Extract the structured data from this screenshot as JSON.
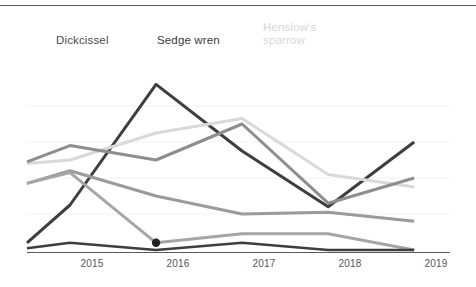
{
  "figure": {
    "background_color": "#ffffff",
    "top_rule_color": "#5a5a5e",
    "axis_color": "#5a5a5e",
    "gridline_color": "#f2f2f2"
  },
  "annotations": {
    "dickcissel": {
      "text": "Dickcissel",
      "color": "#4a4a4e"
    },
    "sedge_wren": {
      "text": "Sedge wren",
      "color": "#3a3a3e"
    },
    "henslows_sparrow": {
      "text": "Henslow's\nsparrow",
      "color": "#d8d8d8"
    }
  },
  "axis": {
    "tick_2015": "2015",
    "tick_2016": "2016",
    "tick_2017": "2017",
    "tick_2018": "2018",
    "tick_2019": "2019"
  },
  "chart_data": {
    "type": "line",
    "title": "",
    "subtitle": "",
    "xlabel": "",
    "ylabel": "",
    "grid": true,
    "grid_axis": "y",
    "legend": "inline-annotations",
    "legend_position": "top",
    "x": [
      2014.5,
      2015,
      2016,
      2017,
      2018,
      2019
    ],
    "xtick_labels": [
      "2015",
      "2016",
      "2017",
      "2018",
      "2019"
    ],
    "xtick_values": [
      2015,
      2016,
      2017,
      2018,
      2019
    ],
    "xlim": [
      2014.5,
      2019.3
    ],
    "ylim": [
      0,
      100
    ],
    "yticks_visible": false,
    "series": [
      {
        "name": "Sedge wren",
        "color": "#3d3d42",
        "width": 3.0,
        "annotated": true,
        "values": [
          4,
          25,
          92,
          55,
          24,
          60
        ],
        "markers": []
      },
      {
        "name": "Henslow's sparrow",
        "color": "#d9d9d9",
        "width": 3.0,
        "annotated": true,
        "values": [
          48,
          50,
          65,
          73,
          42,
          35
        ],
        "markers": []
      },
      {
        "name": "Dickcissel",
        "color": "#8d8d92",
        "width": 3.0,
        "annotated": true,
        "values": [
          49,
          58,
          50,
          70,
          26,
          40
        ],
        "markers": []
      },
      {
        "name": "Series 4",
        "color": "#9a9a9f",
        "width": 3.0,
        "annotated": false,
        "values": [
          37,
          44,
          30,
          20,
          21,
          16
        ],
        "markers": []
      },
      {
        "name": "Series 5",
        "color": "#a5a5aa",
        "width": 3.0,
        "annotated": false,
        "values": [
          37,
          43,
          4,
          9,
          9,
          0
        ],
        "markers": [
          {
            "x": 2016,
            "y": 4,
            "color": "#222226",
            "radius": 4.2
          }
        ]
      },
      {
        "name": "Series 6",
        "color": "#3d3d42",
        "width": 2.6,
        "annotated": false,
        "values": [
          1,
          4,
          0,
          4,
          0,
          0
        ],
        "markers": []
      }
    ]
  }
}
